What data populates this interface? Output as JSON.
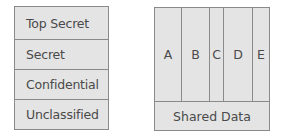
{
  "classification_levels": {
    "levels": [
      {
        "label": "Top Secret"
      },
      {
        "label": "Secret"
      },
      {
        "label": "Confidential"
      },
      {
        "label": "Unclassified"
      }
    ]
  },
  "compartments": {
    "columns": [
      {
        "label": "A"
      },
      {
        "label": "B"
      },
      {
        "label": "C"
      },
      {
        "label": "D"
      },
      {
        "label": "E"
      }
    ],
    "shared_label": "Shared Data"
  },
  "colors": {
    "fill": "#e4e4e4",
    "border": "#8a8a8a",
    "text": "#4a4a4a"
  }
}
